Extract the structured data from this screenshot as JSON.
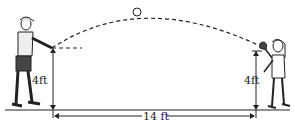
{
  "diagram": {
    "type": "physics-projectile",
    "left_person": "thrower with cap",
    "right_person": "catcher with glove",
    "labels": {
      "left_height": "4ft",
      "right_height": "4ft",
      "distance": "14 ft"
    },
    "colors": {
      "line": "#222222",
      "shorts": "#444444",
      "background": "#ffffff"
    }
  }
}
